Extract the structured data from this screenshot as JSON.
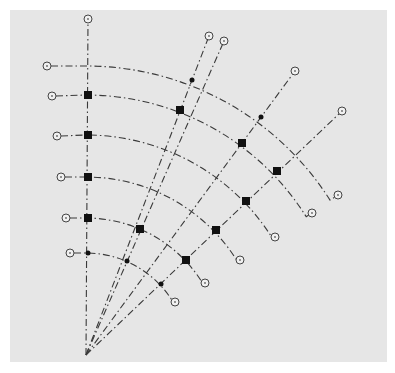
{
  "diagram": {
    "type": "polar-grid-fan",
    "background_color": "#e6e6e6",
    "line_color": "#3a3a3a",
    "marker_color": "#111111",
    "origin": [
      86,
      355
    ],
    "rays": [
      {
        "id": "ray-1",
        "end": [
          88,
          19
        ]
      },
      {
        "id": "ray-2",
        "end": [
          209,
          36
        ]
      },
      {
        "id": "ray-3",
        "end": [
          224,
          41
        ]
      },
      {
        "id": "ray-4",
        "end": [
          295,
          71
        ]
      },
      {
        "id": "ray-5",
        "end": [
          342,
          111
        ]
      }
    ],
    "arcs": [
      {
        "id": "arc-1",
        "radius": 289,
        "start": [
          47,
          66
        ],
        "end": [
          338,
          195
        ]
      },
      {
        "id": "arc-2",
        "radius": 260,
        "start": [
          52,
          96
        ],
        "end": [
          312,
          213
        ]
      },
      {
        "id": "arc-3",
        "radius": 220,
        "start": [
          57,
          136
        ],
        "end": [
          275,
          237
        ]
      },
      {
        "id": "arc-4",
        "radius": 178,
        "start": [
          61,
          177
        ],
        "end": [
          240,
          260
        ]
      },
      {
        "id": "arc-5",
        "radius": 137,
        "start": [
          66,
          218
        ],
        "end": [
          205,
          283
        ]
      },
      {
        "id": "arc-6",
        "radius": 102,
        "start": [
          70,
          253
        ],
        "end": [
          175,
          302
        ]
      }
    ],
    "markers": [
      {
        "shape": "square",
        "at": [
          88,
          95
        ],
        "size": 8
      },
      {
        "shape": "square",
        "at": [
          88,
          135
        ],
        "size": 8
      },
      {
        "shape": "square",
        "at": [
          88,
          177
        ],
        "size": 8
      },
      {
        "shape": "square",
        "at": [
          88,
          218
        ],
        "size": 8
      },
      {
        "shape": "dot",
        "at": [
          88,
          253
        ],
        "size": 4
      },
      {
        "shape": "dot",
        "at": [
          192,
          80
        ],
        "size": 4
      },
      {
        "shape": "square",
        "at": [
          180,
          110
        ],
        "size": 8
      },
      {
        "shape": "dot",
        "at": [
          261,
          117
        ],
        "size": 4
      },
      {
        "shape": "square",
        "at": [
          242,
          143
        ],
        "size": 8
      },
      {
        "shape": "square",
        "at": [
          277,
          171
        ],
        "size": 8
      },
      {
        "shape": "square",
        "at": [
          246,
          201
        ],
        "size": 8
      },
      {
        "shape": "square",
        "at": [
          216,
          230
        ],
        "size": 8
      },
      {
        "shape": "square",
        "at": [
          186,
          260
        ],
        "size": 8
      },
      {
        "shape": "square",
        "at": [
          140,
          229
        ],
        "size": 8
      },
      {
        "shape": "dot",
        "at": [
          127,
          261
        ],
        "size": 4
      },
      {
        "shape": "dot",
        "at": [
          161,
          284
        ],
        "size": 4
      }
    ]
  }
}
